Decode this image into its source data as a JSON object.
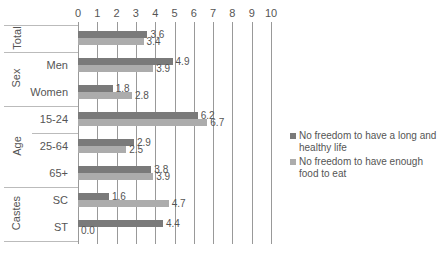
{
  "chart_data": {
    "type": "bar",
    "orientation": "horizontal",
    "title": "",
    "xlabel": "",
    "ylabel": "",
    "xlim": [
      0,
      10
    ],
    "x_ticks": [
      "0",
      "1",
      "2",
      "3",
      "4",
      "5",
      "6",
      "7",
      "8",
      "9",
      "10"
    ],
    "grid": true,
    "legend_position": "right",
    "groups": [
      {
        "name": "Total",
        "categories": [
          ""
        ]
      },
      {
        "name": "Sex",
        "categories": [
          "Men",
          "Women"
        ]
      },
      {
        "name": "Age",
        "categories": [
          "15-24",
          "25-64",
          "65+"
        ]
      },
      {
        "name": "Castes",
        "categories": [
          "SC",
          "ST"
        ]
      }
    ],
    "categories": [
      "Total",
      "Men",
      "Women",
      "15-24",
      "25-64",
      "65+",
      "SC",
      "ST"
    ],
    "series": [
      {
        "name": "No freedom to have a long and healthy life",
        "color": "#7a7a7a",
        "values": [
          3.6,
          4.9,
          1.8,
          6.2,
          2.9,
          3.8,
          1.6,
          4.4
        ]
      },
      {
        "name": "No freedom to have enough food to eat",
        "color": "#acacac",
        "values": [
          3.4,
          3.9,
          2.8,
          6.7,
          2.5,
          3.9,
          4.7,
          0.0
        ]
      }
    ]
  },
  "labels": {
    "groups": [
      "Total",
      "Sex",
      "Age",
      "Castes"
    ],
    "rows": [
      "",
      "Men",
      "Women",
      "15-24",
      "25-64",
      "65+",
      "SC",
      "ST"
    ],
    "values_s0": [
      "3.6",
      "4.9",
      "1.8",
      "6.2",
      "2.9",
      "3.8",
      "1.6",
      "4.4"
    ],
    "values_s1": [
      "3.4",
      "3.9",
      "2.8",
      "6.7",
      "2.5",
      "3.9",
      "4.7",
      "0.0"
    ],
    "legend": [
      "No freedom to have a long and healthy life",
      "No freedom to have enough food to eat"
    ]
  }
}
